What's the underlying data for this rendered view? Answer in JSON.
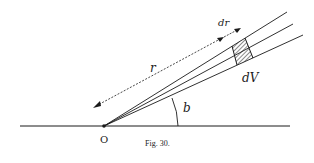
{
  "figure": {
    "caption": "Fig. 30.",
    "labels": {
      "origin": "O",
      "radius": "r",
      "radial_increment": "dr",
      "volume_element": "dV",
      "angle": "b"
    },
    "colors": {
      "ink": "#1a1a1a",
      "background": "#ffffff"
    }
  }
}
